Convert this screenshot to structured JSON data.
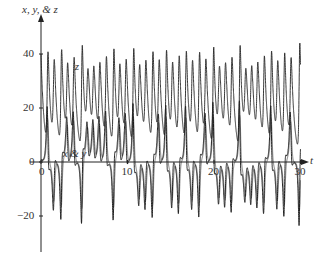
{
  "chart_data": {
    "type": "line",
    "title": "",
    "ylabel": "x, y, & z",
    "xlabel": "t",
    "xlim": [
      0,
      30
    ],
    "ylim": [
      -30,
      50
    ],
    "x_ticks": [
      0,
      10,
      20,
      30
    ],
    "x_tick_labels": [
      "0",
      "10",
      "20",
      "30"
    ],
    "y_ticks": [
      -20,
      0,
      20,
      40
    ],
    "y_tick_labels": [
      "−20",
      "0",
      "20",
      "40"
    ],
    "grid": false,
    "annotations": [
      {
        "text": "z",
        "t": 2.5,
        "y": 35
      },
      {
        "text": "x & y",
        "t": 2.5,
        "y": 2.5
      }
    ],
    "series": [
      {
        "name": "x",
        "color": "#9a9a9a",
        "description": "Lorenz x(t), grey curve"
      },
      {
        "name": "y",
        "color": "#111111",
        "description": "Lorenz y(t), black curve"
      },
      {
        "name": "z",
        "color": "#222222",
        "description": "Lorenz z(t), black curve oscillating around ~25"
      }
    ],
    "model": {
      "system": "Lorenz",
      "sigma": 10,
      "r": 28,
      "b": 2.6667,
      "initial": {
        "x": 0,
        "y": 1,
        "z": 40
      },
      "note": "Transient: z spikes near 48 then settles to oscillate ~22–30 growing to ~8–42; x & y oscillate near 7–12 until t≈14 then switch sign chaotically between about −20 and +20"
    },
    "sample_points": {
      "t": [
        0,
        0.3,
        1,
        3,
        5,
        8,
        11,
        13,
        14.5,
        15.5,
        17,
        19,
        21,
        24,
        27,
        30
      ],
      "z_approx": [
        48,
        22,
        27,
        25,
        27,
        24,
        30,
        35,
        42,
        15,
        38,
        10,
        40,
        12,
        40,
        20
      ],
      "x_approx": [
        0,
        -20,
        8,
        9,
        10,
        9,
        12,
        14,
        5,
        -15,
        -12,
        15,
        -16,
        16,
        -15,
        -18
      ]
    }
  }
}
